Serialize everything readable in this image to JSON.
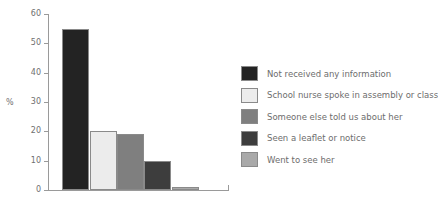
{
  "chart_data": {
    "type": "bar",
    "title": "",
    "xlabel": "",
    "ylabel": "%",
    "ylim": [
      0,
      60
    ],
    "yticks": [
      0,
      10,
      20,
      30,
      40,
      50,
      60
    ],
    "ytick_labels": [
      "0",
      "10",
      "20",
      "30",
      "40",
      "50",
      "60"
    ],
    "grid": false,
    "legend_position": "right",
    "categories": [
      "Not received any information",
      "School nurse spoke in assembly or class",
      "Someone else told us about her",
      "Seen a leaflet or notice",
      "Went to see her"
    ],
    "values": [
      55,
      20,
      19,
      10,
      1
    ],
    "colors": [
      "#232323",
      "#ececec",
      "#7f7f7f",
      "#3d3d3d",
      "#a9a9a9"
    ],
    "bar_edge_color": "#8a8a8a",
    "axis_color": "#9a9a9a"
  },
  "legend": {
    "items": [
      {
        "label": "Not received any information",
        "color": "#232323"
      },
      {
        "label": "School nurse spoke in assembly or class",
        "color": "#ececec"
      },
      {
        "label": "Someone else told us about her",
        "color": "#7f7f7f"
      },
      {
        "label": "Seen a leaflet or notice",
        "color": "#3d3d3d"
      },
      {
        "label": "Went to see her",
        "color": "#a9a9a9"
      }
    ]
  }
}
